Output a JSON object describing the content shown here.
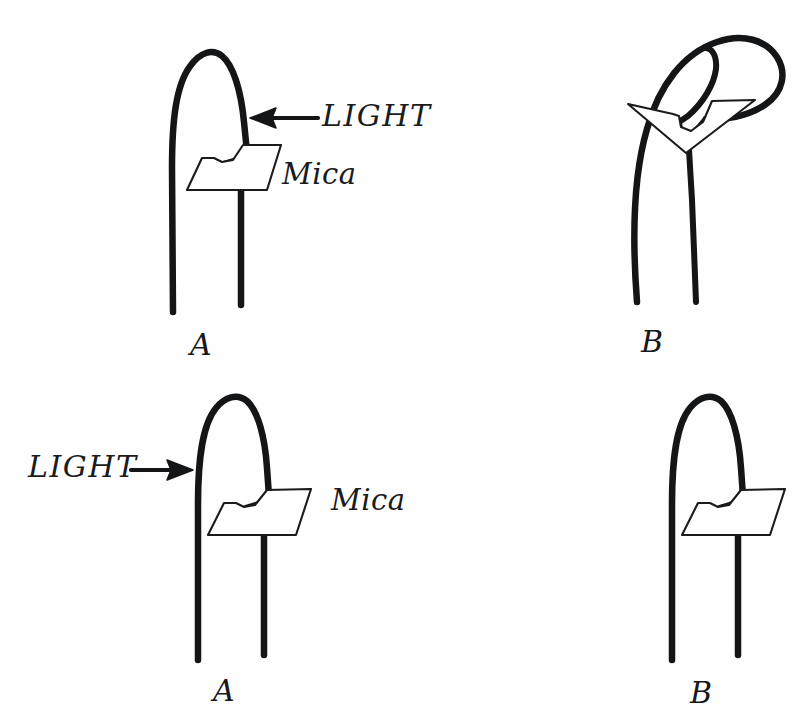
{
  "figure": {
    "background_color": "#fefefe",
    "ink_color": "#1a1b1d",
    "panels": [
      {
        "id": "top-left",
        "label": "A",
        "description": "upright coleoptile with mica plate inserted on the light-facing side below the tip",
        "light_label": "LIGHT",
        "light_direction": "right-to-left",
        "mica_label": "Mica",
        "tip_state": "straight"
      },
      {
        "id": "top-right",
        "label": "B",
        "description": "coleoptile bent toward the light with mica plate tilted with the bend",
        "light_label": "",
        "light_direction": "",
        "mica_label": "",
        "tip_state": "bent"
      },
      {
        "id": "bottom-left",
        "label": "A",
        "description": "upright coleoptile with mica plate inserted on the shaded side below the tip",
        "light_label": "LIGHT",
        "light_direction": "left-to-right",
        "mica_label": "Mica",
        "tip_state": "straight"
      },
      {
        "id": "bottom-right",
        "label": "B",
        "description": "coleoptile remains straight with mica plate on the shaded side",
        "light_label": "",
        "light_direction": "",
        "mica_label": "",
        "tip_state": "straight"
      }
    ],
    "labels": {
      "light_top": "LIGHT",
      "mica_top": "Mica",
      "light_bottom": "LIGHT",
      "mica_bottom": "Mica",
      "panel_a_top": "A",
      "panel_b_top": "B",
      "panel_a_bottom": "A",
      "panel_b_bottom": "B"
    }
  }
}
